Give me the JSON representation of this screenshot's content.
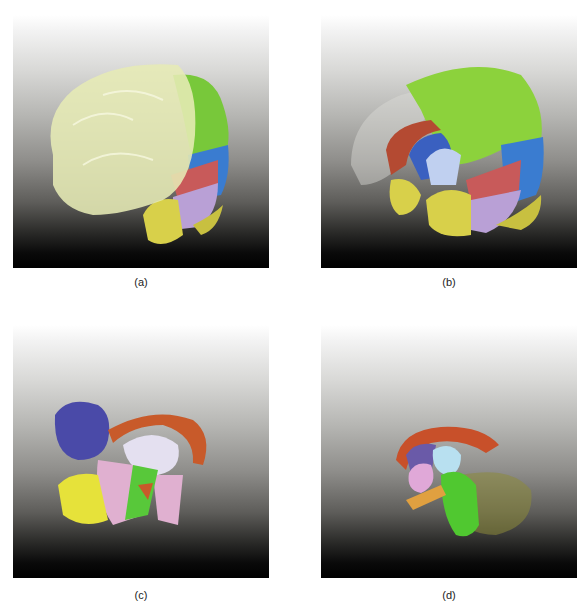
{
  "figure": {
    "panels": [
      {
        "id": "a",
        "label": "(a)",
        "description": "3D rendering of brain with translucent cream-colored hemisphere and colored lobes on right side",
        "colors": {
          "hemisphere_translucent": "#e6ebb5",
          "frontal_green": "#78c83a",
          "occipital_blue": "#3a7cd0",
          "red_region": "#c85a5a",
          "lavender_region": "#b9a0d6",
          "yellow_region": "#d8d04a"
        }
      },
      {
        "id": "b",
        "label": "(b)",
        "description": "Brain with hemisphere made transparent revealing inner structures",
        "colors": {
          "green": "#8cd23c",
          "blue": "#3a7cd0",
          "red_arc": "#b44a32",
          "red_region": "#c85a5a",
          "lavender": "#b9a0d6",
          "pale_blue": "#c0d0f0",
          "yellow": "#d8d04a"
        }
      },
      {
        "id": "c",
        "label": "(c)",
        "description": "Deep structures with blue lobe, orange arc, pink and yellow regions",
        "colors": {
          "indigo": "#4a4aa8",
          "orange_arc": "#c85a2a",
          "pale_white": "#e4e0f0",
          "pink": "#e0b0d0",
          "yellow": "#e6e23a",
          "green": "#58c83a"
        }
      },
      {
        "id": "d",
        "label": "(d)",
        "description": "Inner structures: orange arc, cyan and pink nuclei, green brainstem, translucent olive cerebellum",
        "colors": {
          "orange_arc": "#c8502a",
          "cyan": "#b8e0f0",
          "pink": "#e0a8d8",
          "green": "#50c830",
          "orange_yellow": "#e0a040",
          "olive_translucent": "#8c8a3a",
          "purple": "#6a5aa8"
        }
      }
    ]
  }
}
